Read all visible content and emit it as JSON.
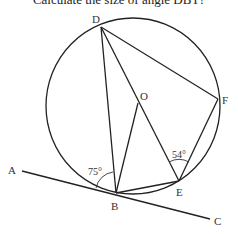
{
  "question": "Calculate the size of angle DBT?",
  "diagram": {
    "points": {
      "D": {
        "label": "D",
        "x": 101,
        "y": 27
      },
      "O": {
        "label": "O",
        "x": 138,
        "y": 103
      },
      "F": {
        "label": "F",
        "x": 218,
        "y": 99
      },
      "B": {
        "label": "B",
        "x": 116,
        "y": 193
      },
      "E": {
        "label": "E",
        "x": 179,
        "y": 181
      },
      "A": {
        "label": "A",
        "x": 22,
        "y": 171
      },
      "C": {
        "label": "C",
        "x": 210,
        "y": 219
      }
    },
    "angles": {
      "at_B": "75°",
      "at_E": "54°"
    },
    "segments": [
      "DB",
      "DE",
      "DF",
      "OB",
      "BE",
      "FE",
      "AC"
    ],
    "circle": {
      "center": "O",
      "cx": 133,
      "cy": 106,
      "rx": 87,
      "ry": 88
    }
  }
}
